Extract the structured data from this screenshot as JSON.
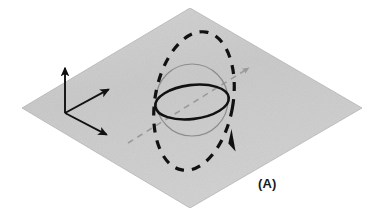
{
  "figure": {
    "panel_label": "(A)",
    "background_color": "#ffffff"
  },
  "colors": {
    "plane_fill": "#c9c9c9",
    "plane_fill_light": "#d6d6d6",
    "plane_edge": "#b4b4b4",
    "axis_stroke": "#111111",
    "sphere_outline": "#8d8d8d",
    "equator_stroke": "#111111",
    "orbit_dashed_stroke": "#111111",
    "spin_axis_stroke": "#9a9a9a",
    "label_color": "#1a1a1a"
  },
  "plane": {
    "name": "reference-plane",
    "shape": "parallelogram",
    "corners": [
      {
        "x": 190,
        "y": 8
      },
      {
        "x": 362,
        "y": 108
      },
      {
        "x": 190,
        "y": 208
      },
      {
        "x": 22,
        "y": 108
      }
    ],
    "fill": "#c9c9c9",
    "opacity": 1
  },
  "axes": {
    "origin": {
      "x": 65,
      "y": 113
    },
    "items": [
      {
        "name": "vertical-axis",
        "direction": "up",
        "from": {
          "x": 65,
          "y": 113
        },
        "to": {
          "x": 65,
          "y": 63
        },
        "arrowhead": true
      },
      {
        "name": "in-plane-axis-upper-right",
        "direction": "up-right",
        "from": {
          "x": 65,
          "y": 113
        },
        "to": {
          "x": 113,
          "y": 87
        },
        "arrowhead": true
      },
      {
        "name": "in-plane-axis-lower-right",
        "direction": "down-right",
        "from": {
          "x": 65,
          "y": 113
        },
        "to": {
          "x": 111,
          "y": 137
        },
        "arrowhead": true
      }
    ]
  },
  "sphere": {
    "name": "sphere-outline",
    "center": {
      "x": 192,
      "y": 100
    },
    "radius": 36,
    "stroke": "#8d8d8d",
    "stroke_width": 1.2,
    "fill": "none"
  },
  "equator": {
    "name": "equator-ellipse",
    "center": {
      "x": 192,
      "y": 102
    },
    "rx": 37,
    "ry": 17,
    "rotation_deg": -7,
    "stroke": "#111111",
    "stroke_width": 2.6,
    "fill": "none"
  },
  "orbit": {
    "name": "orbital-path",
    "style": "dashed",
    "center": {
      "x": 194,
      "y": 101
    },
    "rx": 39,
    "ry": 70,
    "rotation_deg": 10,
    "stroke": "#111111",
    "stroke_width": 3.2,
    "dash_pattern": "9 8",
    "direction_arrow": {
      "name": "orbit-direction-arrowhead",
      "position": {
        "x": 233,
        "y": 140
      },
      "pointing": "down"
    }
  },
  "spin_axis": {
    "name": "spin-axis",
    "style": "dashed",
    "from": {
      "x": 128,
      "y": 143
    },
    "to": {
      "x": 252,
      "y": 66
    },
    "stroke": "#9a9a9a",
    "stroke_width": 1.6,
    "dash_pattern": "6 5",
    "arrowhead": {
      "name": "spin-axis-arrowhead",
      "position": {
        "x": 252,
        "y": 66
      },
      "pointing": "up-right"
    }
  }
}
